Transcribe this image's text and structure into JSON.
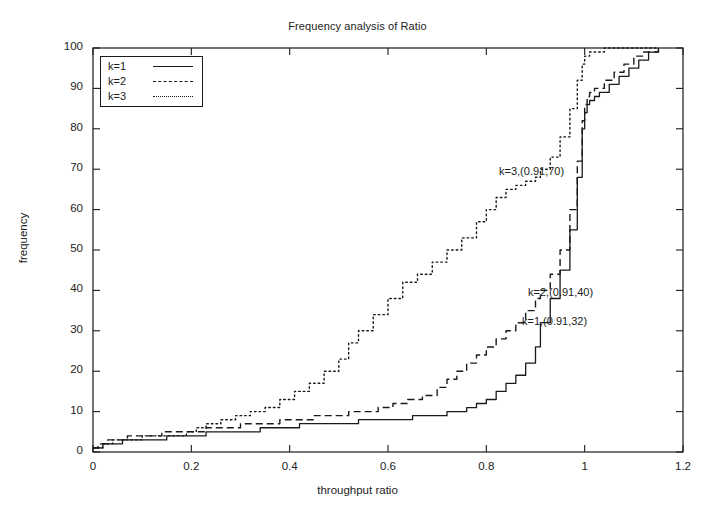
{
  "chart_data": {
    "type": "line",
    "title": "Frequency analysis of Ratio",
    "xlabel": "throughput ratio",
    "ylabel": "frequency",
    "xlim": [
      0,
      1.2
    ],
    "ylim": [
      0,
      100
    ],
    "xticks": [
      "0",
      "0.2",
      "0.4",
      "0.6",
      "0.8",
      "1",
      "1.2"
    ],
    "xtick_values": [
      0,
      0.2,
      0.4,
      0.6,
      0.8,
      1,
      1.2
    ],
    "yticks": [
      "0",
      "10",
      "20",
      "30",
      "40",
      "50",
      "60",
      "70",
      "80",
      "90",
      "100"
    ],
    "ytick_values": [
      0,
      10,
      20,
      30,
      40,
      50,
      60,
      70,
      80,
      90,
      100
    ],
    "grid": false,
    "legend_position": "top-left",
    "series": [
      {
        "name": "k=1",
        "style": "solid",
        "color": "#1a1a1a",
        "x": [
          0.0,
          0.01,
          0.02,
          0.04,
          0.06,
          0.09,
          0.12,
          0.15,
          0.17,
          0.2,
          0.23,
          0.26,
          0.3,
          0.34,
          0.38,
          0.42,
          0.46,
          0.5,
          0.54,
          0.58,
          0.62,
          0.65,
          0.68,
          0.7,
          0.72,
          0.74,
          0.76,
          0.78,
          0.8,
          0.82,
          0.84,
          0.86,
          0.88,
          0.9,
          0.91,
          0.93,
          0.95,
          0.97,
          0.985,
          0.995,
          1.0,
          1.005,
          1.01,
          1.02,
          1.03,
          1.05,
          1.07,
          1.09,
          1.11,
          1.13,
          1.15
        ],
        "y": [
          1,
          1,
          2,
          2,
          3,
          3,
          3,
          4,
          4,
          4,
          5,
          5,
          5,
          6,
          6,
          7,
          7,
          7,
          8,
          8,
          8,
          9,
          9,
          9,
          10,
          10,
          11,
          12,
          13,
          15,
          17,
          19,
          22,
          26,
          32,
          38,
          45,
          55,
          68,
          80,
          84,
          86,
          87,
          88,
          89,
          91,
          93,
          95,
          97,
          99,
          100
        ]
      },
      {
        "name": "k=2",
        "style": "dashed",
        "color": "#1a1a1a",
        "x": [
          0.0,
          0.01,
          0.03,
          0.05,
          0.07,
          0.09,
          0.11,
          0.14,
          0.17,
          0.2,
          0.23,
          0.26,
          0.3,
          0.34,
          0.38,
          0.42,
          0.45,
          0.48,
          0.52,
          0.55,
          0.58,
          0.61,
          0.64,
          0.67,
          0.7,
          0.72,
          0.74,
          0.76,
          0.78,
          0.8,
          0.82,
          0.84,
          0.86,
          0.88,
          0.9,
          0.91,
          0.93,
          0.95,
          0.97,
          0.985,
          0.995,
          1.0,
          1.005,
          1.01,
          1.02,
          1.04,
          1.06,
          1.08,
          1.1,
          1.12,
          1.15
        ],
        "y": [
          1,
          2,
          3,
          3,
          4,
          4,
          4,
          5,
          5,
          5,
          6,
          6,
          7,
          7,
          8,
          8,
          9,
          9,
          10,
          10,
          11,
          12,
          13,
          14,
          16,
          18,
          20,
          22,
          24,
          26,
          28,
          30,
          32,
          35,
          38,
          40,
          44,
          50,
          60,
          72,
          82,
          86,
          88,
          89,
          90,
          92,
          94,
          96,
          98,
          99,
          100
        ]
      },
      {
        "name": "k=3",
        "style": "dotted",
        "color": "#1a1a1a",
        "x": [
          0.0,
          0.02,
          0.04,
          0.06,
          0.08,
          0.1,
          0.13,
          0.16,
          0.19,
          0.21,
          0.23,
          0.26,
          0.29,
          0.32,
          0.35,
          0.38,
          0.41,
          0.44,
          0.47,
          0.5,
          0.52,
          0.54,
          0.57,
          0.6,
          0.63,
          0.66,
          0.69,
          0.72,
          0.75,
          0.78,
          0.8,
          0.82,
          0.84,
          0.86,
          0.88,
          0.9,
          0.91,
          0.93,
          0.95,
          0.97,
          0.985,
          0.995,
          1.0,
          1.01,
          1.02,
          1.04,
          1.06,
          1.08,
          1.1,
          1.12,
          1.15
        ],
        "y": [
          1,
          2,
          3,
          3,
          3,
          4,
          4,
          4,
          5,
          6,
          7,
          8,
          9,
          10,
          11,
          13,
          15,
          17,
          20,
          23,
          27,
          30,
          34,
          38,
          42,
          44,
          47,
          50,
          53,
          57,
          60,
          63,
          65,
          66,
          67,
          68,
          70,
          73,
          78,
          85,
          92,
          96,
          98,
          99,
          99,
          100,
          100,
          100,
          100,
          100,
          100
        ]
      }
    ],
    "annotations": [
      {
        "text": "k=3,(0.91,70)",
        "x": 0.91,
        "y": 70,
        "label_x_px": 499,
        "label_y_px": 165
      },
      {
        "text": "k=2,(0.91,40)",
        "x": 0.91,
        "y": 40,
        "label_x_px": 528,
        "label_y_px": 286
      },
      {
        "text": "k=1,(0.91,32)",
        "x": 0.91,
        "y": 32,
        "label_x_px": 522,
        "label_y_px": 315
      }
    ]
  },
  "legend": {
    "entries": [
      {
        "label": "k=1",
        "style": "solid"
      },
      {
        "label": "k=2",
        "style": "dashed"
      },
      {
        "label": "k=3",
        "style": "dotted"
      }
    ]
  },
  "colors": {
    "axis": "#1a1a1a",
    "background": "#ffffff",
    "line": "#1a1a1a"
  }
}
